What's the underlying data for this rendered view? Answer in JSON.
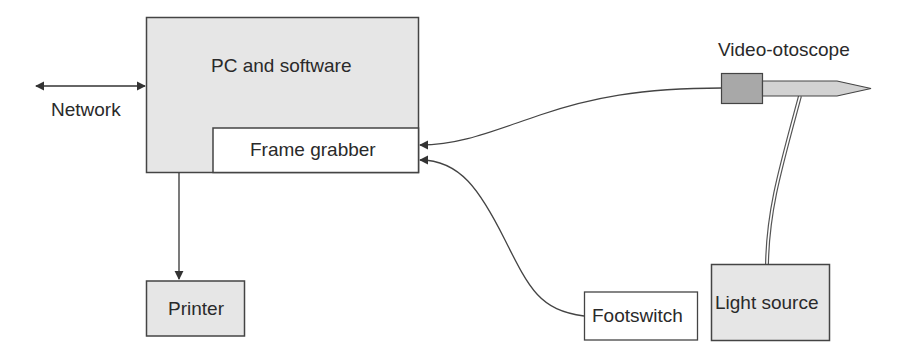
{
  "diagram": {
    "nodes": {
      "pc": {
        "label": "PC and software"
      },
      "frame_grabber": {
        "label": "Frame grabber"
      },
      "printer": {
        "label": "Printer"
      },
      "footswitch": {
        "label": "Footswitch"
      },
      "light_source": {
        "label": "Light source"
      },
      "otoscope": {
        "label": "Video-otoscope"
      },
      "network": {
        "label": "Network"
      }
    },
    "edges": [
      {
        "from": "network",
        "to": "pc",
        "style": "double-arrow"
      },
      {
        "from": "pc",
        "to": "printer",
        "style": "arrow"
      },
      {
        "from": "otoscope",
        "to": "frame_grabber",
        "style": "curved-arrow"
      },
      {
        "from": "footswitch",
        "to": "frame_grabber",
        "style": "curved-arrow"
      },
      {
        "from": "light_source",
        "to": "otoscope",
        "style": "double-line"
      }
    ],
    "colors": {
      "box_fill": "#e6e6e6",
      "otoscope_head": "#a8a8a8",
      "otoscope_shaft": "#d2d2d2",
      "stroke": "#444444"
    }
  }
}
